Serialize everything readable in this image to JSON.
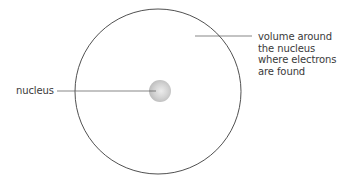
{
  "diagram": {
    "atom_boundary": {
      "shape": "circle",
      "cx": 158,
      "cy": 91.5,
      "rx": 83,
      "ry": 82.5,
      "stroke": "#3c3c3c"
    },
    "nucleus": {
      "cx": 160,
      "cy": 91,
      "r": 11,
      "fill_inner": "#e6e6e6",
      "fill_outer": "#bdbdbd"
    },
    "labels": {
      "nucleus": {
        "text": "nucleus",
        "leader_line": {
          "x1": 57,
          "y1": 91,
          "x2": 156,
          "y2": 91
        }
      },
      "volume": {
        "lines": [
          "volume around",
          "the nucleus",
          "where electrons",
          "are found"
        ],
        "leader_line": {
          "x1": 195,
          "y1": 36,
          "x2": 252,
          "y2": 36
        }
      }
    },
    "colors": {
      "line": "#4a4a4a",
      "text": "#3a3a3a",
      "background": "#ffffff"
    }
  }
}
